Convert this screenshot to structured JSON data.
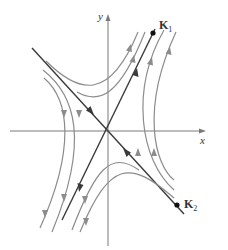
{
  "figure": {
    "type": "phase-portrait",
    "axes": {
      "x_label": "x",
      "y_label": "y"
    },
    "eigenvectors": [
      {
        "name": "K1",
        "label_main": "K",
        "label_sub": "1",
        "direction": "outward from origin (unstable)"
      },
      {
        "name": "K2",
        "label_main": "K",
        "label_sub": "2",
        "direction": "inward toward origin (stable)"
      }
    ],
    "colors": {
      "trajectory": "#8c8c8c",
      "eigenline": "#3a3a3a",
      "axis": "#7a7a7a",
      "background": "#ffffff"
    }
  }
}
